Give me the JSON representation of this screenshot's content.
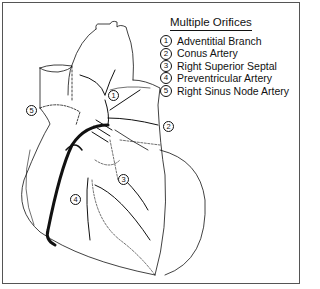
{
  "legend": {
    "title": "Multiple Orifices",
    "items": [
      {
        "num": "1",
        "label": "Adventitial Branch"
      },
      {
        "num": "2",
        "label": "Conus Artery"
      },
      {
        "num": "3",
        "label": "Right Superior Septal"
      },
      {
        "num": "4",
        "label": "Preventricular Artery"
      },
      {
        "num": "5",
        "label": "Right Sinus Node Artery"
      }
    ]
  },
  "callouts": {
    "c1": "1",
    "c2": "2",
    "c3": "3",
    "c4": "4",
    "c5": "5"
  },
  "colors": {
    "line": "#111111",
    "border": "#555555",
    "background": "#ffffff"
  }
}
